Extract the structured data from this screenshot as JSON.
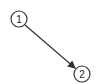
{
  "diagram": {
    "type": "directed-graph",
    "nodes": [
      {
        "id": "1",
        "label": "1",
        "cx": 19,
        "cy": 19,
        "r": 8
      },
      {
        "id": "2",
        "label": "2",
        "cx": 82,
        "cy": 74,
        "r": 8
      }
    ],
    "edges": [
      {
        "from": "1",
        "to": "2",
        "directed": true
      }
    ],
    "colors": {
      "stroke": "#333333",
      "fill": "#ffffff",
      "background": "#ffffff"
    }
  }
}
